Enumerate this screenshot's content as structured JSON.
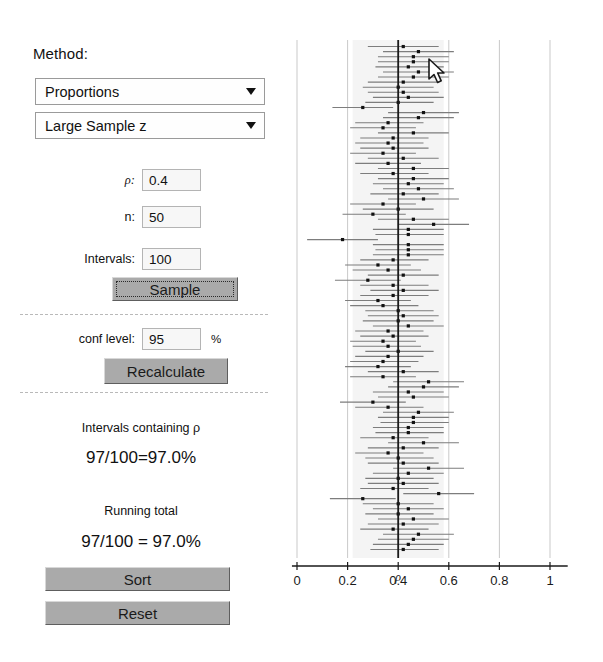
{
  "panel": {
    "method_label": "Method:",
    "method_dropdown": {
      "selected": "Proportions",
      "options": [
        "Proportions",
        "Means"
      ],
      "arrow_icon": "chevron-down-icon"
    },
    "procedure_dropdown": {
      "selected": "Large Sample z",
      "options": [
        "Large Sample z",
        "Wilson",
        "Agresti-Coull",
        "Exact"
      ],
      "arrow_icon": "chevron-down-icon"
    },
    "fields": {
      "p": {
        "label": "ρ:",
        "value": "0.4"
      },
      "n": {
        "label": "n:",
        "value": "50"
      },
      "intervals": {
        "label": "Intervals:",
        "value": "100"
      },
      "conf_level": {
        "label": "conf level:",
        "value": "95",
        "suffix": "%"
      }
    },
    "buttons": {
      "sample": "Sample",
      "recalculate": "Recalculate",
      "sort": "Sort",
      "reset": "Reset"
    },
    "results": {
      "contain_heading": "Intervals containing ρ",
      "contain_value": "97/100=97.0%",
      "running_heading": "Running total",
      "running_value": "97/100 = 97.0%"
    }
  },
  "chart_data": {
    "type": "line",
    "title": "",
    "xlabel": "",
    "ylabel": "",
    "xlim": [
      -0.03,
      1.12
    ],
    "ylim": [
      0,
      100
    ],
    "grid": true,
    "legend_position": "none",
    "tick_labels": [
      "0",
      "0.2",
      "0.4",
      "0.6",
      "0.8",
      "1"
    ],
    "tick_values": [
      0,
      0.2,
      0.4,
      0.6,
      0.8,
      1
    ],
    "reference_line": {
      "value": 0.4,
      "label": "ρ",
      "color": "#1a1a1a"
    },
    "shaded_band": [
      0.22,
      0.58
    ],
    "series_name": "confidence intervals",
    "n_intervals": 100,
    "interval_color": "#7d7d7d",
    "point_color": "#111111",
    "intervals": [
      {
        "center": 0.42,
        "lo": 0.28,
        "hi": 0.56,
        "covers": true
      },
      {
        "center": 0.48,
        "lo": 0.34,
        "hi": 0.62,
        "covers": true
      },
      {
        "center": 0.46,
        "lo": 0.32,
        "hi": 0.6,
        "covers": true
      },
      {
        "center": 0.46,
        "lo": 0.32,
        "hi": 0.6,
        "covers": true
      },
      {
        "center": 0.44,
        "lo": 0.31,
        "hi": 0.58,
        "covers": true
      },
      {
        "center": 0.48,
        "lo": 0.34,
        "hi": 0.62,
        "covers": true
      },
      {
        "center": 0.46,
        "lo": 0.32,
        "hi": 0.6,
        "covers": true
      },
      {
        "center": 0.42,
        "lo": 0.28,
        "hi": 0.56,
        "covers": true
      },
      {
        "center": 0.4,
        "lo": 0.26,
        "hi": 0.54,
        "covers": true
      },
      {
        "center": 0.42,
        "lo": 0.28,
        "hi": 0.56,
        "covers": true
      },
      {
        "center": 0.44,
        "lo": 0.3,
        "hi": 0.58,
        "covers": true
      },
      {
        "center": 0.4,
        "lo": 0.27,
        "hi": 0.54,
        "covers": true
      },
      {
        "center": 0.26,
        "lo": 0.14,
        "hi": 0.38,
        "covers": false
      },
      {
        "center": 0.5,
        "lo": 0.36,
        "hi": 0.64,
        "covers": true
      },
      {
        "center": 0.48,
        "lo": 0.34,
        "hi": 0.62,
        "covers": true
      },
      {
        "center": 0.36,
        "lo": 0.23,
        "hi": 0.5,
        "covers": true
      },
      {
        "center": 0.34,
        "lo": 0.21,
        "hi": 0.47,
        "covers": true
      },
      {
        "center": 0.46,
        "lo": 0.32,
        "hi": 0.6,
        "covers": true
      },
      {
        "center": 0.38,
        "lo": 0.25,
        "hi": 0.52,
        "covers": true
      },
      {
        "center": 0.36,
        "lo": 0.23,
        "hi": 0.5,
        "covers": true
      },
      {
        "center": 0.38,
        "lo": 0.25,
        "hi": 0.52,
        "covers": true
      },
      {
        "center": 0.34,
        "lo": 0.21,
        "hi": 0.47,
        "covers": true
      },
      {
        "center": 0.42,
        "lo": 0.28,
        "hi": 0.56,
        "covers": true
      },
      {
        "center": 0.36,
        "lo": 0.23,
        "hi": 0.49,
        "covers": true
      },
      {
        "center": 0.46,
        "lo": 0.32,
        "hi": 0.6,
        "covers": true
      },
      {
        "center": 0.38,
        "lo": 0.25,
        "hi": 0.52,
        "covers": true
      },
      {
        "center": 0.46,
        "lo": 0.32,
        "hi": 0.6,
        "covers": true
      },
      {
        "center": 0.44,
        "lo": 0.3,
        "hi": 0.58,
        "covers": true
      },
      {
        "center": 0.48,
        "lo": 0.34,
        "hi": 0.62,
        "covers": true
      },
      {
        "center": 0.42,
        "lo": 0.29,
        "hi": 0.56,
        "covers": true
      },
      {
        "center": 0.5,
        "lo": 0.36,
        "hi": 0.64,
        "covers": true
      },
      {
        "center": 0.34,
        "lo": 0.21,
        "hi": 0.47,
        "covers": true
      },
      {
        "center": 0.4,
        "lo": 0.26,
        "hi": 0.54,
        "covers": true
      },
      {
        "center": 0.3,
        "lo": 0.18,
        "hi": 0.43,
        "covers": true
      },
      {
        "center": 0.46,
        "lo": 0.32,
        "hi": 0.6,
        "covers": true
      },
      {
        "center": 0.54,
        "lo": 0.4,
        "hi": 0.68,
        "covers": true
      },
      {
        "center": 0.44,
        "lo": 0.3,
        "hi": 0.58,
        "covers": true
      },
      {
        "center": 0.44,
        "lo": 0.31,
        "hi": 0.58,
        "covers": true
      },
      {
        "center": 0.18,
        "lo": 0.04,
        "hi": 0.32,
        "covers": false
      },
      {
        "center": 0.44,
        "lo": 0.3,
        "hi": 0.58,
        "covers": true
      },
      {
        "center": 0.44,
        "lo": 0.31,
        "hi": 0.58,
        "covers": true
      },
      {
        "center": 0.44,
        "lo": 0.3,
        "hi": 0.58,
        "covers": true
      },
      {
        "center": 0.38,
        "lo": 0.25,
        "hi": 0.52,
        "covers": true
      },
      {
        "center": 0.32,
        "lo": 0.19,
        "hi": 0.45,
        "covers": true
      },
      {
        "center": 0.36,
        "lo": 0.22,
        "hi": 0.49,
        "covers": true
      },
      {
        "center": 0.42,
        "lo": 0.28,
        "hi": 0.56,
        "covers": true
      },
      {
        "center": 0.28,
        "lo": 0.15,
        "hi": 0.41,
        "covers": true
      },
      {
        "center": 0.38,
        "lo": 0.25,
        "hi": 0.52,
        "covers": true
      },
      {
        "center": 0.42,
        "lo": 0.29,
        "hi": 0.56,
        "covers": true
      },
      {
        "center": 0.38,
        "lo": 0.25,
        "hi": 0.52,
        "covers": true
      },
      {
        "center": 0.32,
        "lo": 0.19,
        "hi": 0.45,
        "covers": true
      },
      {
        "center": 0.34,
        "lo": 0.21,
        "hi": 0.48,
        "covers": true
      },
      {
        "center": 0.4,
        "lo": 0.27,
        "hi": 0.54,
        "covers": true
      },
      {
        "center": 0.42,
        "lo": 0.28,
        "hi": 0.56,
        "covers": true
      },
      {
        "center": 0.4,
        "lo": 0.26,
        "hi": 0.54,
        "covers": true
      },
      {
        "center": 0.44,
        "lo": 0.3,
        "hi": 0.58,
        "covers": true
      },
      {
        "center": 0.36,
        "lo": 0.23,
        "hi": 0.5,
        "covers": true
      },
      {
        "center": 0.38,
        "lo": 0.25,
        "hi": 0.52,
        "covers": true
      },
      {
        "center": 0.34,
        "lo": 0.21,
        "hi": 0.47,
        "covers": true
      },
      {
        "center": 0.36,
        "lo": 0.22,
        "hi": 0.49,
        "covers": true
      },
      {
        "center": 0.4,
        "lo": 0.27,
        "hi": 0.54,
        "covers": true
      },
      {
        "center": 0.36,
        "lo": 0.23,
        "hi": 0.5,
        "covers": true
      },
      {
        "center": 0.34,
        "lo": 0.21,
        "hi": 0.48,
        "covers": true
      },
      {
        "center": 0.32,
        "lo": 0.19,
        "hi": 0.45,
        "covers": true
      },
      {
        "center": 0.42,
        "lo": 0.28,
        "hi": 0.56,
        "covers": true
      },
      {
        "center": 0.34,
        "lo": 0.21,
        "hi": 0.47,
        "covers": true
      },
      {
        "center": 0.52,
        "lo": 0.38,
        "hi": 0.66,
        "covers": true
      },
      {
        "center": 0.5,
        "lo": 0.36,
        "hi": 0.64,
        "covers": true
      },
      {
        "center": 0.44,
        "lo": 0.3,
        "hi": 0.58,
        "covers": true
      },
      {
        "center": 0.46,
        "lo": 0.32,
        "hi": 0.6,
        "covers": true
      },
      {
        "center": 0.3,
        "lo": 0.17,
        "hi": 0.43,
        "covers": true
      },
      {
        "center": 0.36,
        "lo": 0.23,
        "hi": 0.5,
        "covers": true
      },
      {
        "center": 0.48,
        "lo": 0.34,
        "hi": 0.62,
        "covers": true
      },
      {
        "center": 0.46,
        "lo": 0.32,
        "hi": 0.6,
        "covers": true
      },
      {
        "center": 0.46,
        "lo": 0.33,
        "hi": 0.6,
        "covers": true
      },
      {
        "center": 0.44,
        "lo": 0.3,
        "hi": 0.58,
        "covers": true
      },
      {
        "center": 0.44,
        "lo": 0.31,
        "hi": 0.58,
        "covers": true
      },
      {
        "center": 0.38,
        "lo": 0.25,
        "hi": 0.52,
        "covers": true
      },
      {
        "center": 0.5,
        "lo": 0.36,
        "hi": 0.64,
        "covers": true
      },
      {
        "center": 0.42,
        "lo": 0.28,
        "hi": 0.56,
        "covers": true
      },
      {
        "center": 0.36,
        "lo": 0.23,
        "hi": 0.5,
        "covers": true
      },
      {
        "center": 0.4,
        "lo": 0.27,
        "hi": 0.54,
        "covers": true
      },
      {
        "center": 0.42,
        "lo": 0.28,
        "hi": 0.56,
        "covers": true
      },
      {
        "center": 0.52,
        "lo": 0.38,
        "hi": 0.66,
        "covers": true
      },
      {
        "center": 0.44,
        "lo": 0.3,
        "hi": 0.58,
        "covers": true
      },
      {
        "center": 0.4,
        "lo": 0.27,
        "hi": 0.54,
        "covers": true
      },
      {
        "center": 0.42,
        "lo": 0.28,
        "hi": 0.56,
        "covers": true
      },
      {
        "center": 0.38,
        "lo": 0.25,
        "hi": 0.52,
        "covers": true
      },
      {
        "center": 0.56,
        "lo": 0.42,
        "hi": 0.7,
        "covers": true
      },
      {
        "center": 0.26,
        "lo": 0.13,
        "hi": 0.39,
        "covers": true
      },
      {
        "center": 0.4,
        "lo": 0.26,
        "hi": 0.54,
        "covers": true
      },
      {
        "center": 0.44,
        "lo": 0.3,
        "hi": 0.58,
        "covers": true
      },
      {
        "center": 0.4,
        "lo": 0.27,
        "hi": 0.54,
        "covers": true
      },
      {
        "center": 0.46,
        "lo": 0.32,
        "hi": 0.6,
        "covers": true
      },
      {
        "center": 0.42,
        "lo": 0.28,
        "hi": 0.56,
        "covers": true
      },
      {
        "center": 0.38,
        "lo": 0.25,
        "hi": 0.52,
        "covers": true
      },
      {
        "center": 0.48,
        "lo": 0.34,
        "hi": 0.62,
        "covers": true
      },
      {
        "center": 0.46,
        "lo": 0.32,
        "hi": 0.6,
        "covers": true
      },
      {
        "center": 0.44,
        "lo": 0.3,
        "hi": 0.58,
        "covers": true
      },
      {
        "center": 0.42,
        "lo": 0.29,
        "hi": 0.56,
        "covers": true
      }
    ]
  },
  "cursor": {
    "icon": "mouse-pointer-icon"
  }
}
